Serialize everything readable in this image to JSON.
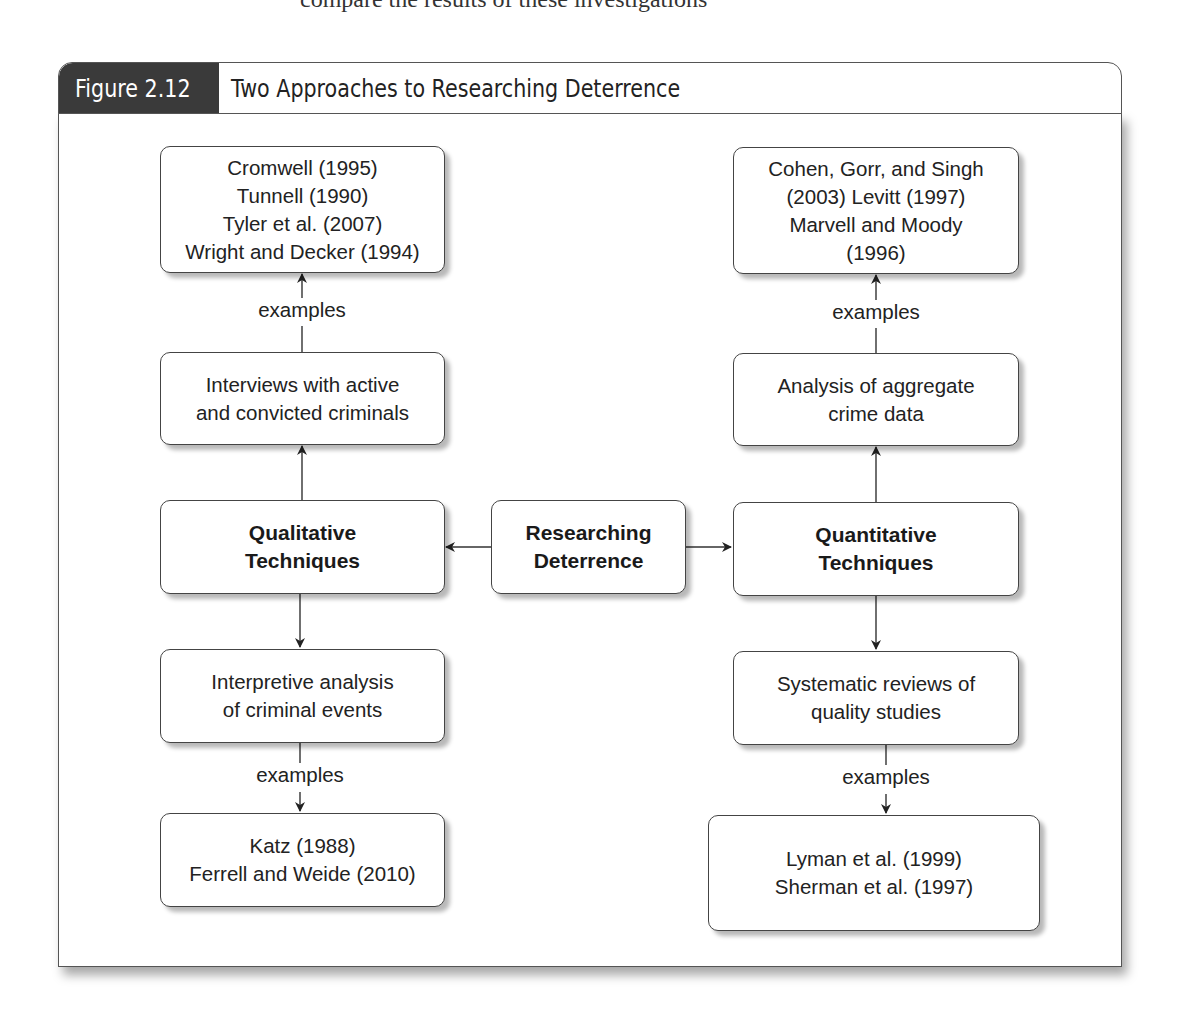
{
  "page_fragment": {
    "text": "compare the results of these investigations"
  },
  "figure": {
    "number": "Figure 2.12",
    "title": "Two Approaches to Researching Deterrence"
  },
  "nodes": {
    "center": "Researching\nDeterrence",
    "qualitative": "Qualitative\nTechniques",
    "quantitative": "Quantitative\nTechniques",
    "interviews": "Interviews with active\nand convicted criminals",
    "interpretive": "Interpretive analysis\nof criminal events",
    "aggregate": "Analysis of aggregate\ncrime data",
    "systematic": "Systematic reviews of\nquality studies",
    "refs_interviews": "Cromwell (1995)\nTunnell (1990)\nTyler et al. (2007)\nWright and Decker (1994)",
    "refs_interpretive": "Katz (1988)\nFerrell and Weide (2010)",
    "refs_aggregate": "Cohen, Gorr, and Singh\n(2003) Levitt (1997)\nMarvell and Moody\n(1996)",
    "refs_systematic": "Lyman et al. (1999)\nSherman et al. (1997)"
  },
  "edge_labels": {
    "examples_1": "examples",
    "examples_2": "examples",
    "examples_3": "examples",
    "examples_4": "examples"
  },
  "colors": {
    "tab_bg": "#3a3a3a",
    "tab_text": "#ffffff",
    "border": "#444444",
    "text": "#222222"
  }
}
